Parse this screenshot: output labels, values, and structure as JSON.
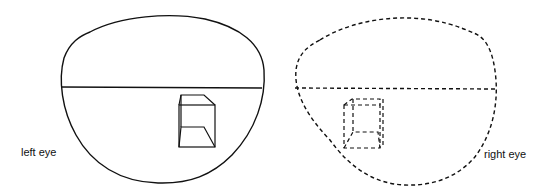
{
  "labels": {
    "left": "left eye",
    "right": "right eye"
  },
  "colors": {
    "stroke": "#111111",
    "background": "#ffffff"
  }
}
